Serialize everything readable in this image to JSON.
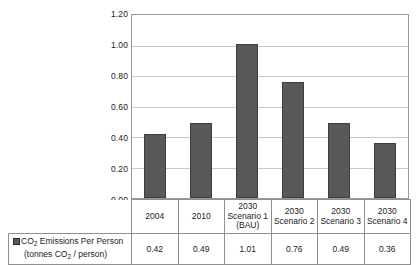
{
  "chart_data": {
    "type": "bar",
    "title": "",
    "subtitle": "",
    "xlabel": "",
    "ylabel": "",
    "categories": [
      "2004",
      "2010",
      "2030 Scenario 1 (BAU)",
      "2030 Scenario 2",
      "2030 Scenario 3",
      "2030 Scenario 4"
    ],
    "category_lines": [
      [
        "2004"
      ],
      [
        "2010"
      ],
      [
        "2030",
        "Scenario 1",
        "(BAU)"
      ],
      [
        "2030",
        "Scenario 2"
      ],
      [
        "2030",
        "Scenario 3"
      ],
      [
        "2030",
        "Scenario 4"
      ]
    ],
    "values": [
      0.42,
      0.49,
      1.01,
      0.76,
      0.49,
      0.36
    ],
    "value_labels": [
      "0.42",
      "0.49",
      "1.01",
      "0.76",
      "0.49",
      "0.36"
    ],
    "series": [
      {
        "name": "CO2 Emissions Per Person (tonnes CO2 / person)",
        "values": [
          0.42,
          0.49,
          1.01,
          0.76,
          0.49,
          0.36
        ],
        "color": "#585859"
      }
    ],
    "ylim": [
      0.0,
      1.2
    ],
    "ytick_labels": [
      "0.00",
      "0.20",
      "0.40",
      "0.60",
      "0.80",
      "1.00",
      "1.20"
    ],
    "ytick_values": [
      0.0,
      0.2,
      0.4,
      0.6,
      0.8,
      1.0,
      1.2
    ],
    "grid": true,
    "legend_position": "bottom-left-table"
  },
  "legend": {
    "line1_text": "CO",
    "line1_sub": "2",
    "line1_rest": " Emissions Per Person",
    "line2_prefix": "(tonnes CO",
    "line2_sub": "2",
    "line2_rest": " / person)",
    "swatch_color": "#585859"
  },
  "axis": {
    "ticks": [
      {
        "label": "1.20"
      },
      {
        "label": "1.00"
      },
      {
        "label": "0.80"
      },
      {
        "label": "0.60"
      },
      {
        "label": "0.40"
      },
      {
        "label": "0.20"
      },
      {
        "label": "0.00"
      }
    ]
  },
  "colors": {
    "bar_fill": "#585859",
    "bar_stroke": "#3d3d3e",
    "gridline": "#c9c9c9",
    "plot_border": "#9a9a9a",
    "table_border": "#8f8f8f",
    "text": "#1a1a1a",
    "background": "#ffffff"
  }
}
